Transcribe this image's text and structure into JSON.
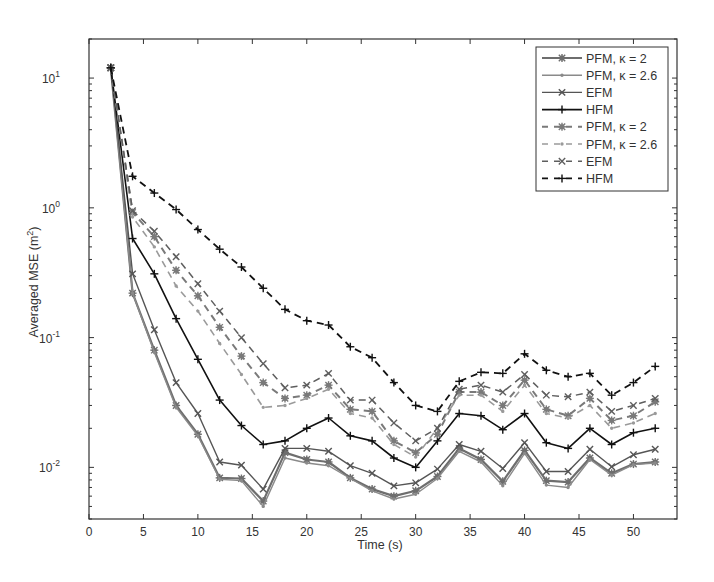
{
  "chart_data": {
    "type": "line",
    "title": "",
    "xlabel": "Time (s)",
    "ylabel": "Averaged MSE (m²)",
    "ylabel_base": "Averaged MSE (m",
    "ylabel_sup": "2",
    "ylabel_tail": ")",
    "xlim": [
      0,
      54
    ],
    "ylim": [
      0.004,
      20
    ],
    "yscale": "log",
    "grid": false,
    "legend_position": "upper right",
    "x_ticks": [
      0,
      5,
      10,
      15,
      20,
      25,
      30,
      35,
      40,
      45,
      50
    ],
    "x_tick_labels": [
      "0",
      "5",
      "10",
      "15",
      "20",
      "25",
      "30",
      "35",
      "40",
      "45",
      "50"
    ],
    "y_ticks": [
      10,
      1,
      0.1,
      0.01
    ],
    "y_tick_labels": [
      {
        "base": "10",
        "exp": "1"
      },
      {
        "base": "10",
        "exp": "0"
      },
      {
        "base": "10",
        "exp": "-1"
      },
      {
        "base": "10",
        "exp": "-2"
      }
    ],
    "x": [
      2,
      4,
      6,
      8,
      10,
      12,
      14,
      16,
      18,
      20,
      22,
      24,
      26,
      28,
      30,
      32,
      34,
      36,
      38,
      40,
      42,
      44,
      46,
      48,
      50,
      52
    ],
    "series": [
      {
        "name": "PFM, κ = 2",
        "style": "solid",
        "marker": "star",
        "color": "#6e6e6e",
        "width": 2.2,
        "values": [
          12,
          0.22,
          0.08,
          0.03,
          0.018,
          0.0083,
          0.0082,
          0.0055,
          0.013,
          0.0115,
          0.011,
          0.0083,
          0.0068,
          0.006,
          0.0066,
          0.0085,
          0.014,
          0.0115,
          0.0078,
          0.0135,
          0.0079,
          0.0077,
          0.0118,
          0.009,
          0.0106,
          0.011
        ]
      },
      {
        "name": "PFM, κ = 2.6",
        "style": "solid",
        "marker": "point",
        "color": "#8a8a8a",
        "width": 1.4,
        "values": [
          12,
          0.22,
          0.077,
          0.029,
          0.0175,
          0.0081,
          0.0079,
          0.005,
          0.0118,
          0.0108,
          0.0103,
          0.0082,
          0.0066,
          0.0057,
          0.0062,
          0.0082,
          0.0133,
          0.011,
          0.0072,
          0.0128,
          0.0073,
          0.007,
          0.0115,
          0.0087,
          0.0105,
          0.0108
        ]
      },
      {
        "name": "EFM",
        "style": "solid",
        "marker": "x",
        "color": "#555555",
        "width": 1.4,
        "values": [
          12,
          0.31,
          0.115,
          0.045,
          0.026,
          0.011,
          0.0104,
          0.0068,
          0.014,
          0.014,
          0.0133,
          0.0103,
          0.009,
          0.0072,
          0.0076,
          0.0097,
          0.015,
          0.0133,
          0.0098,
          0.0155,
          0.0093,
          0.0093,
          0.0138,
          0.0101,
          0.0125,
          0.0138
        ]
      },
      {
        "name": "HFM",
        "style": "solid",
        "marker": "plus",
        "color": "#111111",
        "width": 1.6,
        "values": [
          12,
          0.58,
          0.31,
          0.14,
          0.068,
          0.033,
          0.021,
          0.015,
          0.016,
          0.02,
          0.024,
          0.0175,
          0.016,
          0.0118,
          0.01,
          0.016,
          0.026,
          0.025,
          0.0195,
          0.026,
          0.0155,
          0.014,
          0.02,
          0.015,
          0.0185,
          0.02
        ]
      },
      {
        "name": "PFM, κ = 2",
        "style": "dashed",
        "marker": "star",
        "color": "#7a7a7a",
        "width": 2.0,
        "values": [
          12,
          0.92,
          0.6,
          0.33,
          0.21,
          0.12,
          0.072,
          0.045,
          0.034,
          0.036,
          0.043,
          0.028,
          0.027,
          0.016,
          0.013,
          0.018,
          0.038,
          0.038,
          0.03,
          0.047,
          0.028,
          0.025,
          0.034,
          0.023,
          0.025,
          0.032
        ]
      },
      {
        "name": "PFM, κ = 2.6",
        "style": "dashed",
        "marker": "point",
        "color": "#9a9a9a",
        "width": 1.6,
        "values": [
          12,
          0.85,
          0.5,
          0.25,
          0.16,
          0.09,
          0.052,
          0.029,
          0.03,
          0.034,
          0.04,
          0.026,
          0.024,
          0.015,
          0.012,
          0.02,
          0.036,
          0.036,
          0.027,
          0.043,
          0.026,
          0.024,
          0.03,
          0.02,
          0.022,
          0.026
        ]
      },
      {
        "name": "EFM",
        "style": "dashed",
        "marker": "x",
        "color": "#5e5e5e",
        "width": 1.5,
        "values": [
          12,
          0.95,
          0.66,
          0.42,
          0.26,
          0.16,
          0.1,
          0.063,
          0.041,
          0.043,
          0.053,
          0.033,
          0.033,
          0.022,
          0.016,
          0.02,
          0.04,
          0.043,
          0.038,
          0.052,
          0.036,
          0.035,
          0.038,
          0.027,
          0.03,
          0.034
        ]
      },
      {
        "name": "HFM",
        "style": "dashed",
        "marker": "plus",
        "color": "#111111",
        "width": 1.8,
        "values": [
          12,
          1.75,
          1.3,
          0.97,
          0.68,
          0.48,
          0.35,
          0.24,
          0.165,
          0.135,
          0.125,
          0.085,
          0.07,
          0.045,
          0.03,
          0.027,
          0.046,
          0.054,
          0.053,
          0.075,
          0.056,
          0.05,
          0.053,
          0.036,
          0.045,
          0.06
        ]
      }
    ]
  }
}
